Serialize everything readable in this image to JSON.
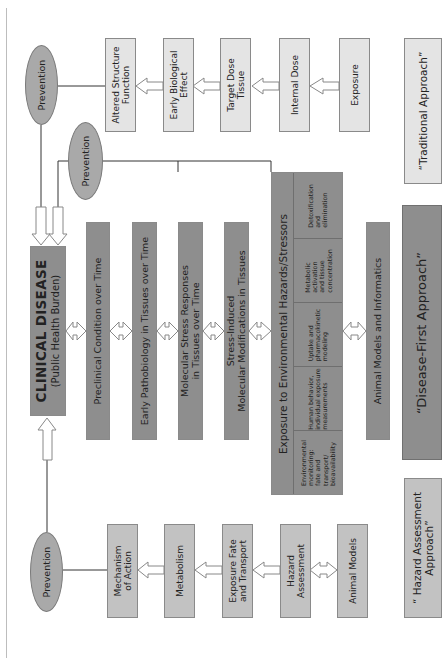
{
  "diagram": {
    "orientation": "rotated-90-ccw",
    "colors": {
      "light_box": "#e4e4e4",
      "mid_box": "#c2c2c2",
      "dark_box": "#8e8e8e",
      "prevention_ellipse": "#a9a9a9",
      "border": "#8a8a8a"
    },
    "traditional": {
      "prevention": "Prevention",
      "steps": [
        {
          "label": "Altered Structure\nFunction"
        },
        {
          "label": "Early Biological\nEffect"
        },
        {
          "label": "Target Dose\nTissue"
        },
        {
          "label": "Internal Dose"
        },
        {
          "label": "Exposure"
        }
      ],
      "approach_label": "“Traditional Approach”"
    },
    "disease_first": {
      "prevention": "Prevention",
      "clinical_title": "CLINICAL DISEASE",
      "clinical_subtitle": "(Public Health Burden)",
      "stages": [
        {
          "label": "Preclinical Condition over Time"
        },
        {
          "label": "Early Pathobiology in Tissues over Time"
        },
        {
          "label": "Molecular Stress Responses\nin Tissues over Time"
        },
        {
          "label": "Stress-Induced\nMolecular Modifications in Tissues"
        }
      ],
      "exposure_title": "Exposure to Environmental Hazards/Stressors",
      "exposure_cells": [
        {
          "label": "Environmental\nmonitoring:\nfate and\ntransport/\nbioavailability"
        },
        {
          "label": "Human behavior,\nindividual exposure\nmeasurements"
        },
        {
          "label": "Uptake and\npharmacokinetic\nmodeling"
        },
        {
          "label": "Metabolic\nactivation\nand tissue\nconcentration"
        },
        {
          "label": "Detoxification\nand\nelimination"
        }
      ],
      "animal_models": "Animal Models and Informatics",
      "approach_label": "“Disease-First Approach”"
    },
    "hazard": {
      "prevention": "Prevention",
      "steps": [
        {
          "label": "Mechanism\nof Action"
        },
        {
          "label": "Metabolism"
        },
        {
          "label": "Exposure Fate\nand Transport"
        },
        {
          "label": "Hazard\nAssessment"
        },
        {
          "label": "Animal Models"
        }
      ],
      "approach_label": "“ Hazard Assessment\nApproach”"
    }
  }
}
